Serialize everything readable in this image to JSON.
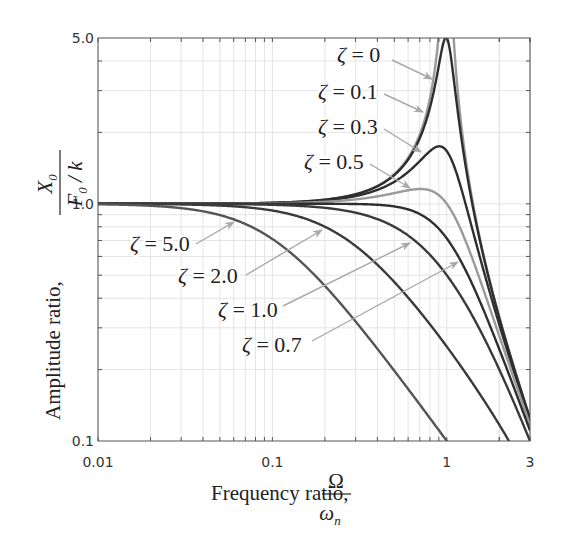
{
  "chart_data": {
    "type": "line",
    "title": "",
    "xlabel": "Frequency ratio, Ω/ω_n",
    "ylabel": "Amplitude ratio, X_0/(F_0/k)",
    "xscale": "log",
    "yscale": "log",
    "xlim": [
      0.01,
      3
    ],
    "ylim": [
      0.1,
      5.0
    ],
    "grid": true,
    "legend": "inline annotations with arrows",
    "x_ticks": [
      {
        "value": 0.01,
        "label": "0.01"
      },
      {
        "value": 0.1,
        "label": "0.1"
      },
      {
        "value": 1,
        "label": "1"
      },
      {
        "value": 3,
        "label": "3"
      }
    ],
    "y_ticks": [
      {
        "value": 0.1,
        "label": "0.1"
      },
      {
        "value": 1.0,
        "label": "1.0"
      },
      {
        "value": 5.0,
        "label": "5.0"
      }
    ],
    "x": [
      0.01,
      0.1,
      0.2,
      0.3,
      0.5,
      0.7,
      0.8,
      0.9,
      1.0,
      1.2,
      1.5,
      2.0,
      3.0
    ],
    "series": [
      {
        "name": "ζ = 0",
        "zeta": 0,
        "color": "#9a9a9a",
        "values": [
          1.0,
          1.01,
          1.042,
          1.099,
          1.333,
          1.961,
          2.778,
          5.263,
          null,
          2.273,
          0.8,
          0.333,
          0.125
        ]
      },
      {
        "name": "ζ = 0.1",
        "zeta": 0.1,
        "color": "#2e2e2e",
        "values": [
          1.0,
          1.01,
          1.041,
          1.097,
          1.322,
          1.891,
          2.538,
          3.821,
          5.0,
          1.995,
          0.778,
          0.33,
          0.125
        ]
      },
      {
        "name": "ζ = 0.3",
        "zeta": 0.3,
        "color": "#2e2e2e",
        "values": [
          1.0,
          1.008,
          1.034,
          1.078,
          1.238,
          1.514,
          1.667,
          1.747,
          1.667,
          1.185,
          0.649,
          0.31,
          0.122
        ]
      },
      {
        "name": "ζ = 0.5",
        "zeta": 0.5,
        "color": "#9a9a9a",
        "values": [
          1.0,
          1.005,
          1.02,
          1.044,
          1.109,
          1.155,
          1.14,
          1.087,
          1.0,
          0.782,
          0.512,
          0.277,
          0.117
        ]
      },
      {
        "name": "ζ = 0.7",
        "zeta": 0.7,
        "color": "#2e2e2e",
        "values": [
          1.0,
          1.0,
          1.0,
          0.998,
          0.975,
          0.905,
          0.85,
          0.785,
          0.714,
          0.576,
          0.409,
          0.244,
          0.111
        ]
      },
      {
        "name": "ζ = 1.0",
        "zeta": 1.0,
        "color": "#3a3a3a",
        "values": [
          1.0,
          0.99,
          0.962,
          0.917,
          0.8,
          0.671,
          0.61,
          0.553,
          0.5,
          0.41,
          0.308,
          0.2,
          0.1
        ]
      },
      {
        "name": "ζ = 2.0",
        "zeta": 2.0,
        "color": "#3a3a3a",
        "values": [
          1.0,
          0.937,
          0.8,
          0.664,
          0.468,
          0.351,
          0.307,
          0.275,
          0.25,
          0.206,
          0.163,
          0.117,
          null
        ]
      },
      {
        "name": "ζ = 5.0",
        "zeta": 5.0,
        "color": "#555555",
        "values": [
          1.0,
          0.711,
          0.451,
          0.319,
          0.198,
          0.143,
          0.124,
          0.11,
          0.1,
          null,
          null,
          null,
          null
        ]
      }
    ],
    "annotations": [
      {
        "text": "ζ = 0",
        "label_xy": [
          337,
          62
        ],
        "arrow_from": [
          392,
          60
        ],
        "arrow_to": [
          432,
          79
        ]
      },
      {
        "text": "ζ = 0.1",
        "label_xy": [
          318,
          99
        ],
        "arrow_from": [
          384,
          94
        ],
        "arrow_to": [
          423,
          112
        ]
      },
      {
        "text": "ζ = 0.3",
        "label_xy": [
          318,
          134
        ],
        "arrow_from": [
          384,
          129
        ],
        "arrow_to": [
          421,
          152
        ]
      },
      {
        "text": "ζ = 0.5",
        "label_xy": [
          304,
          169
        ],
        "arrow_from": [
          370,
          164
        ],
        "arrow_to": [
          410,
          188
        ]
      },
      {
        "text": "ζ = 5.0",
        "label_xy": [
          130,
          251
        ],
        "arrow_from": [
          196,
          244
        ],
        "arrow_to": [
          234,
          222
        ]
      },
      {
        "text": "ζ = 2.0",
        "label_xy": [
          178,
          283
        ],
        "arrow_from": [
          246,
          275
        ],
        "arrow_to": [
          322,
          230
        ]
      },
      {
        "text": "ζ = 1.0",
        "label_xy": [
          218,
          317
        ],
        "arrow_from": [
          283,
          306
        ],
        "arrow_to": [
          410,
          243
        ]
      },
      {
        "text": "ζ = 0.7",
        "label_xy": [
          242,
          352
        ],
        "arrow_from": [
          312,
          341
        ],
        "arrow_to": [
          458,
          262
        ]
      }
    ]
  },
  "axes": {
    "x_title_text": "Frequency ratio,",
    "x_title_num": "Ω",
    "x_title_den": "ω",
    "x_title_den_sub": "n",
    "y_title_text": "Amplitude ratio,",
    "y_title_num": "X",
    "y_title_num_sub": "0",
    "y_title_den": "F",
    "y_title_den_sub": "0",
    "y_title_den_tail": " / k"
  }
}
